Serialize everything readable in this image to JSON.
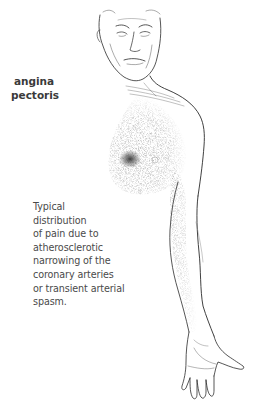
{
  "figure": {
    "title_lines": [
      "angina",
      "pectoris"
    ],
    "caption_lines": [
      "Typical",
      "distribution",
      "of pain due to",
      "atherosclerotic",
      "narrowing of the",
      "coronary arteries",
      "or transient arterial",
      "spasm."
    ],
    "illustration": {
      "subject": "older man, head and left side of torso with left arm extended down",
      "pain_region": "left chest and inner left arm (stippled shading)",
      "focal_point": "darkest spot over left pectoral area"
    },
    "colors": {
      "background": "#ffffff",
      "line_art": "#2b2b2b",
      "stipple": "#6e6e6e",
      "focal_shading": "#3c3c3c",
      "title_text": "#3a3a3a",
      "caption_text": "#4a4a4a"
    }
  }
}
